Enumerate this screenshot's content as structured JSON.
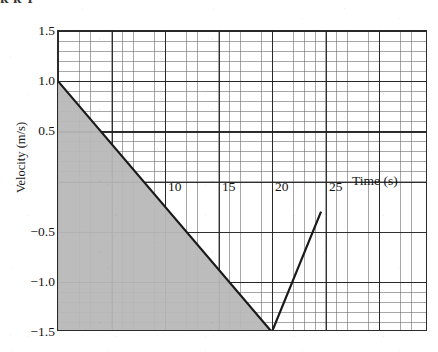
{
  "top_cut_text": "ʀ  ʀ  ʏ",
  "chart_data": {
    "type": "line",
    "title": "",
    "xlabel": "Time (s)",
    "ylabel": "Velocity (m/s)",
    "xlim": [
      0,
      34.6
    ],
    "ylim": [
      -1.5,
      1.5
    ],
    "grid": true,
    "grid_major_x_step": 5,
    "grid_minor_x_step": 1,
    "grid_major_y_step": 0.5,
    "grid_minor_y_step": 0.1,
    "legend": null,
    "xticks": [
      10,
      15,
      20,
      25
    ],
    "xtick_labels": [
      "10",
      "15",
      "20",
      "25"
    ],
    "yticks": [
      1.5,
      1.0,
      0.5,
      -0.5,
      -1.0,
      -1.5
    ],
    "ytick_labels": [
      "1.5",
      "1.0",
      "0.5",
      "−0.5",
      "−1.0",
      "−1.5"
    ],
    "series": [
      {
        "name": "velocity",
        "color": "#1a1a1a",
        "linewidth": 2.2,
        "points": [
          {
            "x": 0,
            "y": 1.0
          },
          {
            "x": 20,
            "y": -1.5
          },
          {
            "x": 24.6,
            "y": -0.3
          }
        ]
      }
    ],
    "shaded_regions": [
      {
        "name": "area-under-curve-negative",
        "color": "#b8b8b8",
        "description": "Region bounded by the descending velocity line, the left axis and the bottom of the plot",
        "vertices": [
          {
            "x": 0,
            "y": 1.0
          },
          {
            "x": 20,
            "y": -1.5
          },
          {
            "x": 0,
            "y": -1.5
          }
        ]
      }
    ]
  }
}
